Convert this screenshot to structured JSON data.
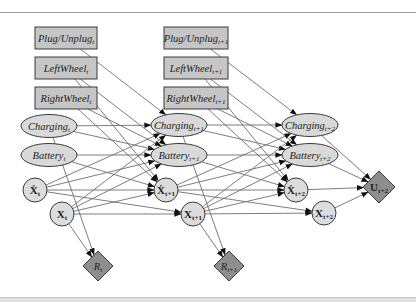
{
  "colors": {
    "box_fill": "#c6c6c6",
    "ellipse_fill": "#d9d9d9",
    "circle_fill": "#dcdcdc",
    "diamond_fill": "#8e8e8e",
    "stroke": "#3a3a3a",
    "edge": "#6e6e6e"
  },
  "nodes": [
    {
      "id": "plug_t",
      "shape": "box",
      "base": "Plug/Unplug",
      "sub": "t",
      "x": 66,
      "y": 38,
      "w": 62,
      "h": 22,
      "style": "italic"
    },
    {
      "id": "left_t",
      "shape": "box",
      "base": "LeftWheel",
      "sub": "t",
      "x": 66,
      "y": 68,
      "w": 62,
      "h": 22,
      "style": "italic"
    },
    {
      "id": "right_t",
      "shape": "box",
      "base": "RightWheel",
      "sub": "t",
      "x": 66,
      "y": 98,
      "w": 62,
      "h": 22,
      "style": "italic"
    },
    {
      "id": "charge_t",
      "shape": "ellipse",
      "base": "Charging",
      "sub": "t",
      "x": 49,
      "y": 126,
      "rx": 28,
      "ry": 11.5,
      "style": "italic"
    },
    {
      "id": "batt_t",
      "shape": "ellipse",
      "base": "Battery",
      "sub": "t",
      "x": 49,
      "y": 155,
      "rx": 28,
      "ry": 11.5,
      "style": "italic"
    },
    {
      "id": "xdot_t",
      "shape": "circle",
      "base": "Ẋ",
      "sub": "t",
      "x": 35,
      "y": 190,
      "r": 12,
      "style": "bold"
    },
    {
      "id": "x_t",
      "shape": "circle",
      "base": "X",
      "sub": "t",
      "x": 62,
      "y": 214,
      "r": 12,
      "style": "bold"
    },
    {
      "id": "r_t",
      "shape": "diamond",
      "base": "R",
      "sub": "t",
      "x": 98,
      "y": 266,
      "h": 15,
      "style": "italic"
    },
    {
      "id": "plug_t1",
      "shape": "box",
      "base": "Plug/Unplug",
      "sub": "t+1",
      "x": 196,
      "y": 38,
      "w": 64,
      "h": 22,
      "style": "italic"
    },
    {
      "id": "left_t1",
      "shape": "box",
      "base": "LeftWheel",
      "sub": "t+1",
      "x": 196,
      "y": 68,
      "w": 64,
      "h": 22,
      "style": "italic"
    },
    {
      "id": "right_t1",
      "shape": "box",
      "base": "RightWheel",
      "sub": "t+1",
      "x": 196,
      "y": 98,
      "w": 64,
      "h": 22,
      "style": "italic"
    },
    {
      "id": "charge_t1",
      "shape": "ellipse",
      "base": "Charging",
      "sub": "t+1",
      "x": 179,
      "y": 125,
      "rx": 28,
      "ry": 11.5,
      "style": "italic"
    },
    {
      "id": "batt_t1",
      "shape": "ellipse",
      "base": "Battery",
      "sub": "t+1",
      "x": 179,
      "y": 155,
      "rx": 28,
      "ry": 11.5,
      "style": "italic"
    },
    {
      "id": "xdot_t1",
      "shape": "circle",
      "base": "Ẋ",
      "sub": "t+1",
      "x": 166,
      "y": 190,
      "r": 12,
      "style": "bold"
    },
    {
      "id": "x_t1",
      "shape": "circle",
      "base": "X",
      "sub": "t+1",
      "x": 193,
      "y": 214,
      "r": 12,
      "style": "bold"
    },
    {
      "id": "r_t1",
      "shape": "diamond",
      "base": "R",
      "sub": "t+1",
      "x": 229,
      "y": 266,
      "h": 15,
      "style": "italic"
    },
    {
      "id": "charge_t2",
      "shape": "ellipse",
      "base": "Charging",
      "sub": "t+2",
      "x": 310,
      "y": 125,
      "rx": 28,
      "ry": 11.5,
      "style": "italic"
    },
    {
      "id": "batt_t2",
      "shape": "ellipse",
      "base": "Battery",
      "sub": "t+2",
      "x": 310,
      "y": 155,
      "rx": 28,
      "ry": 11.5,
      "style": "italic"
    },
    {
      "id": "xdot_t2",
      "shape": "circle",
      "base": "Ẋ",
      "sub": "t+2",
      "x": 296,
      "y": 190,
      "r": 12,
      "style": "bold"
    },
    {
      "id": "x_t2",
      "shape": "circle",
      "base": "X",
      "sub": "t+2",
      "x": 324,
      "y": 213,
      "r": 12,
      "style": "bold"
    },
    {
      "id": "u_t2",
      "shape": "diamond",
      "base": "U",
      "sub": "t+2",
      "x": 379,
      "y": 187,
      "h": 16,
      "style": "bold"
    }
  ],
  "edges": [
    [
      "plug_t",
      "charge_t1"
    ],
    [
      "left_t",
      "xdot_t1"
    ],
    [
      "left_t",
      "batt_t1"
    ],
    [
      "right_t",
      "xdot_t1"
    ],
    [
      "right_t",
      "batt_t1"
    ],
    [
      "charge_t",
      "charge_t1"
    ],
    [
      "charge_t",
      "batt_t1"
    ],
    [
      "charge_t",
      "r_t"
    ],
    [
      "batt_t",
      "batt_t1"
    ],
    [
      "batt_t",
      "xdot_t1"
    ],
    [
      "xdot_t",
      "charge_t1"
    ],
    [
      "xdot_t",
      "batt_t1"
    ],
    [
      "xdot_t",
      "xdot_t1"
    ],
    [
      "xdot_t",
      "x_t1"
    ],
    [
      "x_t",
      "charge_t1"
    ],
    [
      "x_t",
      "batt_t1"
    ],
    [
      "x_t",
      "xdot_t1"
    ],
    [
      "x_t",
      "x_t1"
    ],
    [
      "x_t",
      "r_t"
    ],
    [
      "plug_t1",
      "charge_t2"
    ],
    [
      "left_t1",
      "xdot_t2"
    ],
    [
      "left_t1",
      "batt_t2"
    ],
    [
      "right_t1",
      "xdot_t2"
    ],
    [
      "right_t1",
      "batt_t2"
    ],
    [
      "charge_t1",
      "charge_t2"
    ],
    [
      "charge_t1",
      "batt_t2"
    ],
    [
      "charge_t1",
      "r_t1"
    ],
    [
      "batt_t1",
      "batt_t2"
    ],
    [
      "batt_t1",
      "xdot_t2"
    ],
    [
      "xdot_t1",
      "charge_t2"
    ],
    [
      "xdot_t1",
      "batt_t2"
    ],
    [
      "xdot_t1",
      "xdot_t2"
    ],
    [
      "xdot_t1",
      "x_t2"
    ],
    [
      "x_t1",
      "charge_t2"
    ],
    [
      "x_t1",
      "batt_t2"
    ],
    [
      "x_t1",
      "xdot_t2"
    ],
    [
      "x_t1",
      "x_t2"
    ],
    [
      "x_t1",
      "r_t1"
    ],
    [
      "charge_t2",
      "u_t2"
    ],
    [
      "batt_t2",
      "u_t2"
    ],
    [
      "xdot_t2",
      "u_t2"
    ],
    [
      "x_t2",
      "u_t2"
    ]
  ]
}
